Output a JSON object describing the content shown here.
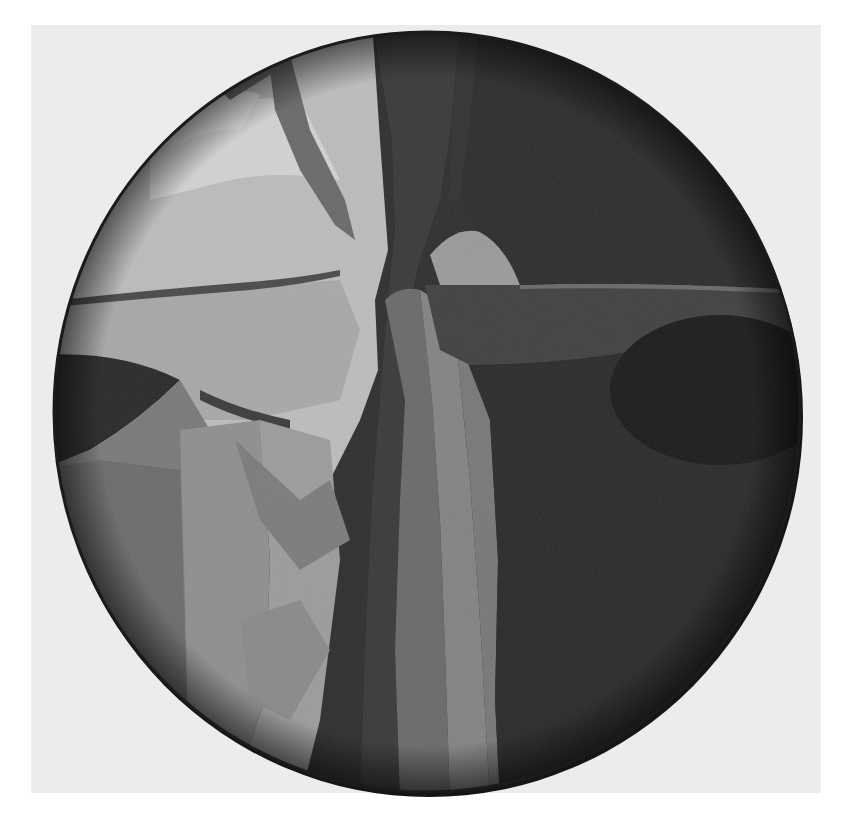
{
  "image": {
    "description": "Grayscale photograph of a circular abstract painting (tondo) on a light textured backdrop",
    "subject": "circular-abstract-painting",
    "colors": {
      "page_background": "#ffffff",
      "backdrop": "#ececec",
      "light_region": "#bdbdbd",
      "mid_region": "#8a8a8a",
      "dark_region": "#2e2e2e",
      "darkest_region": "#1a1a1a",
      "rim_shadow": "#141414"
    },
    "canvas": {
      "center_x": 427,
      "center_y": 412,
      "radius_x": 374,
      "radius_y": 380
    }
  }
}
